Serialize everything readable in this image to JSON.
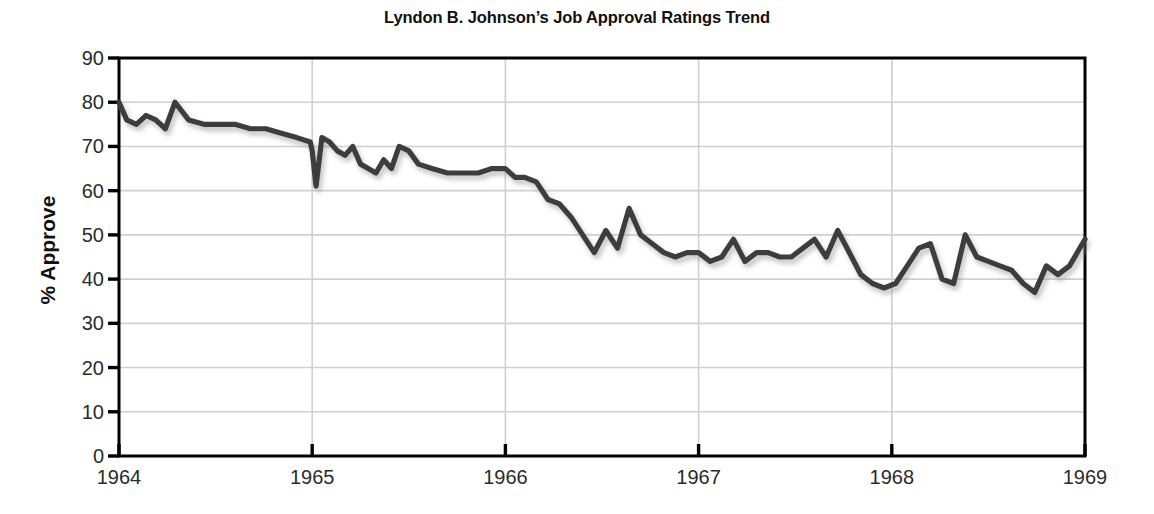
{
  "chart_data": {
    "type": "line",
    "title": "Lyndon B. Johnson’s Job Approval Ratings Trend",
    "xlabel": "",
    "ylabel": "% Approve",
    "ylim": [
      0,
      90
    ],
    "ytick_step": 10,
    "yticks": [
      "90",
      "80",
      "70",
      "60",
      "50",
      "40",
      "30",
      "20",
      "10",
      "0"
    ],
    "xlim": [
      1964.0,
      1969.0
    ],
    "xticks": [
      "1964",
      "1965",
      "1966",
      "1967",
      "1968",
      "1969"
    ],
    "grid": true,
    "legend": "none",
    "series": [
      {
        "name": "% Approve",
        "color": "#3d3d3d",
        "x": [
          1963.98,
          1964.04,
          1964.09,
          1964.14,
          1964.19,
          1964.24,
          1964.29,
          1964.36,
          1964.44,
          1964.52,
          1964.6,
          1964.68,
          1964.76,
          1964.84,
          1964.92,
          1964.99,
          1965.0,
          1965.02,
          1965.05,
          1965.09,
          1965.13,
          1965.17,
          1965.21,
          1965.25,
          1965.29,
          1965.33,
          1965.37,
          1965.41,
          1965.45,
          1965.5,
          1965.55,
          1965.62,
          1965.7,
          1965.78,
          1965.86,
          1965.93,
          1966.0,
          1966.05,
          1966.1,
          1966.16,
          1966.22,
          1966.28,
          1966.34,
          1966.4,
          1966.46,
          1966.52,
          1966.58,
          1966.64,
          1966.7,
          1966.76,
          1966.82,
          1966.88,
          1966.94,
          1967.0,
          1967.06,
          1967.12,
          1967.18,
          1967.24,
          1967.3,
          1967.36,
          1967.42,
          1967.48,
          1967.54,
          1967.6,
          1967.66,
          1967.72,
          1967.78,
          1967.84,
          1967.9,
          1967.96,
          1968.02,
          1968.08,
          1968.14,
          1968.2,
          1968.26,
          1968.32,
          1968.38,
          1968.44,
          1968.5,
          1968.56,
          1968.62,
          1968.68,
          1968.74,
          1968.8,
          1968.86,
          1968.92,
          1969.0
        ],
        "y": [
          80,
          76,
          75,
          77,
          76,
          74,
          80,
          76,
          75,
          75,
          75,
          74,
          74,
          73,
          72,
          71,
          69,
          61,
          72,
          71,
          69,
          68,
          70,
          66,
          65,
          64,
          67,
          65,
          70,
          69,
          66,
          65,
          64,
          64,
          64,
          65,
          65,
          63,
          63,
          62,
          58,
          57,
          54,
          50,
          46,
          51,
          47,
          56,
          50,
          48,
          46,
          45,
          46,
          46,
          44,
          45,
          49,
          44,
          46,
          46,
          45,
          45,
          47,
          49,
          45,
          51,
          46,
          41,
          39,
          38,
          39,
          43,
          47,
          48,
          40,
          39,
          50,
          45,
          44,
          43,
          42,
          39,
          37,
          43,
          41,
          43,
          49
        ]
      }
    ]
  },
  "axes": {
    "y_ticks": [
      {
        "label": "90",
        "value": 90
      },
      {
        "label": "80",
        "value": 80
      },
      {
        "label": "70",
        "value": 70
      },
      {
        "label": "60",
        "value": 60
      },
      {
        "label": "50",
        "value": 50
      },
      {
        "label": "40",
        "value": 40
      },
      {
        "label": "30",
        "value": 30
      },
      {
        "label": "20",
        "value": 20
      },
      {
        "label": "10",
        "value": 10
      },
      {
        "label": "0",
        "value": 0
      }
    ],
    "x_ticks": [
      {
        "label": "1964",
        "value": 1964
      },
      {
        "label": "1965",
        "value": 1965
      },
      {
        "label": "1966",
        "value": 1966
      },
      {
        "label": "1967",
        "value": 1967
      },
      {
        "label": "1968",
        "value": 1968
      },
      {
        "label": "1969",
        "value": 1969
      }
    ]
  },
  "colors": {
    "line": "#3d3d3d",
    "grid": "#d0d0d0",
    "axis": "#000000",
    "background": "#ffffff",
    "text": "#2b2b2b"
  }
}
